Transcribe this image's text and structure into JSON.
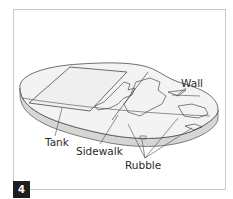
{
  "figure": {
    "number": "4",
    "labels": {
      "wall": "Wall",
      "tank": "Tank",
      "sidewalk": "Sidewalk",
      "rubble": "Rubble"
    }
  },
  "colors": {
    "top_surface": "#f2f2f2",
    "side_surface": "#d4d4d4",
    "outline": "#4a4a4a",
    "frame_border": "#c8c8c8",
    "number_badge": "#1e1e1e"
  }
}
